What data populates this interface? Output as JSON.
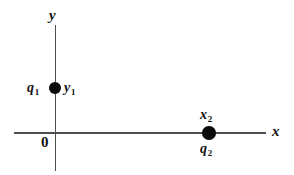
{
  "figure": {
    "background_color": "#ffffff",
    "axis_color": "#4f4f4f",
    "marker_color": "#0a0a0a",
    "label_color": "#121212",
    "axes": {
      "x_axis_label": "x",
      "y_axis_label": "y",
      "origin_label": "0"
    },
    "points": [
      {
        "name": "charge-1",
        "charge_label": "q",
        "charge_subscript": "1",
        "coordinate_label": "y",
        "coordinate_subscript": "1",
        "on_axis": "y",
        "charge_label_position": "left",
        "coordinate_label_position": "right"
      },
      {
        "name": "charge-2",
        "charge_label": "q",
        "charge_subscript": "2",
        "coordinate_label": "x",
        "coordinate_subscript": "2",
        "on_axis": "x",
        "charge_label_position": "below",
        "coordinate_label_position": "above"
      }
    ]
  },
  "chart_data": {
    "type": "scatter",
    "title": "",
    "xlabel": "x",
    "ylabel": "y",
    "grid": false,
    "legend": null,
    "axis_style": "cartesian-cross",
    "origin_label": "0",
    "points": [
      {
        "label": "q1",
        "x": 0,
        "y": 1,
        "annotations": [
          "q_1",
          "y_1"
        ],
        "placement": "on positive y-axis above origin"
      },
      {
        "label": "q2",
        "x": 1,
        "y": 0,
        "annotations": [
          "x_2",
          "q_2"
        ],
        "placement": "on positive x-axis right of origin"
      }
    ]
  }
}
